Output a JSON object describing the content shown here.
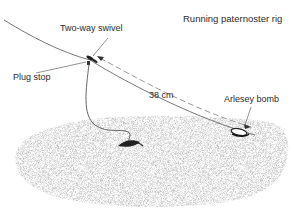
{
  "title": "Running paternoster rig",
  "labels": {
    "swivel": "Two-way swivel",
    "plug_stop": "Plug stop",
    "distance": "38 cm",
    "weight": "Arlesey bomb"
  },
  "colors": {
    "line": "#555555",
    "seabed": "#bdbdbd",
    "text": "#2a2a2a"
  }
}
